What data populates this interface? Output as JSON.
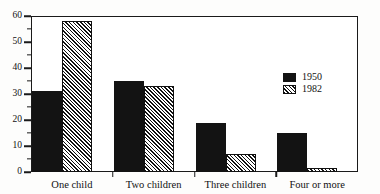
{
  "chart_data": {
    "type": "bar",
    "title": "",
    "subtitle": "",
    "xlabel": "",
    "ylabel": "",
    "categories": [
      "One child",
      "Two children",
      "Three children",
      "Four or more"
    ],
    "series": [
      {
        "name": "1950",
        "values": [
          31,
          35,
          19,
          15
        ],
        "color": "#131313",
        "fill": "solid"
      },
      {
        "name": "1982",
        "values": [
          58,
          33,
          7,
          1.5
        ],
        "color": "#111111",
        "fill": "diagonal-hatch"
      }
    ],
    "ylim": [
      0,
      60
    ],
    "ytick_labels": [
      "0",
      "10",
      "20",
      "30",
      "40",
      "50",
      "60"
    ],
    "ytick_values": [
      0,
      10,
      20,
      30,
      40,
      50,
      60
    ],
    "yminor_values": [
      5,
      15,
      25,
      35,
      45,
      55
    ],
    "grid": false,
    "frame": true,
    "legend_position": "inside-right"
  },
  "legend": {
    "entries": [
      {
        "label": "1950"
      },
      {
        "label": "1982"
      }
    ]
  }
}
